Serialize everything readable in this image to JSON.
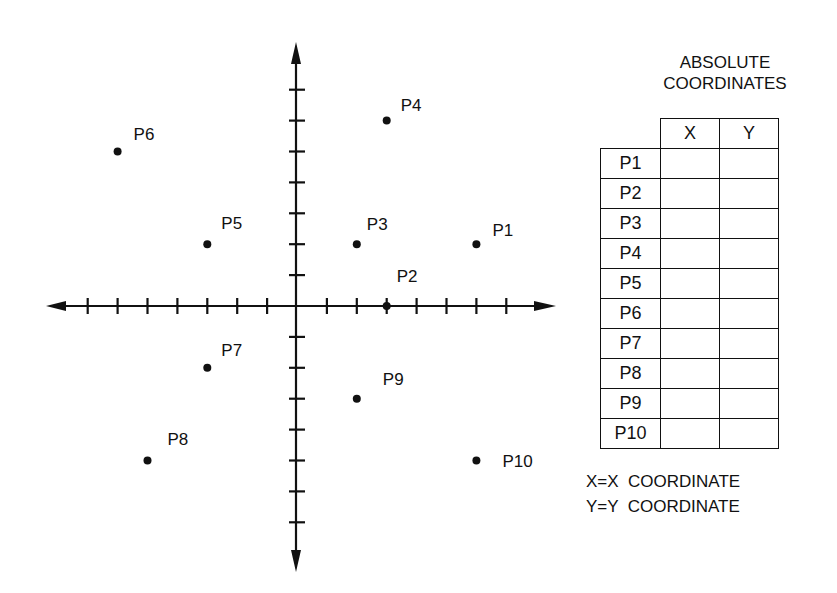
{
  "chart_data": {
    "type": "scatter",
    "title": "",
    "xlabel": "",
    "ylabel": "",
    "xlim": [
      -8,
      8
    ],
    "ylim": [
      -8,
      8
    ],
    "grid": false,
    "tick_spacing": 1,
    "points": [
      {
        "label": "P1",
        "x": 6,
        "y": 2
      },
      {
        "label": "P2",
        "x": 3,
        "y": 0
      },
      {
        "label": "P3",
        "x": 2,
        "y": 2
      },
      {
        "label": "P4",
        "x": 3,
        "y": 6
      },
      {
        "label": "P5",
        "x": -3,
        "y": 2
      },
      {
        "label": "P6",
        "x": -6,
        "y": 5
      },
      {
        "label": "P7",
        "x": -3,
        "y": -2
      },
      {
        "label": "P8",
        "x": -5,
        "y": -5
      },
      {
        "label": "P9",
        "x": 2,
        "y": -3
      },
      {
        "label": "P10",
        "x": 6,
        "y": -5
      }
    ]
  },
  "table": {
    "title_line1": "ABSOLUTE",
    "title_line2": "COORDINATES",
    "col_x": "X",
    "col_y": "Y",
    "rows": [
      {
        "label": "P1",
        "x": "",
        "y": ""
      },
      {
        "label": "P2",
        "x": "",
        "y": ""
      },
      {
        "label": "P3",
        "x": "",
        "y": ""
      },
      {
        "label": "P4",
        "x": "",
        "y": ""
      },
      {
        "label": "P5",
        "x": "",
        "y": ""
      },
      {
        "label": "P6",
        "x": "",
        "y": ""
      },
      {
        "label": "P7",
        "x": "",
        "y": ""
      },
      {
        "label": "P8",
        "x": "",
        "y": ""
      },
      {
        "label": "P9",
        "x": "",
        "y": ""
      },
      {
        "label": "P10",
        "x": "",
        "y": ""
      }
    ]
  },
  "legend": {
    "line1": "X=X  COORDINATE",
    "line2": "Y=Y  COORDINATE"
  }
}
